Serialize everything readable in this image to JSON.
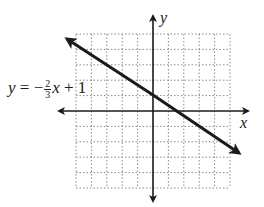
{
  "chart_data": {
    "type": "line",
    "title": "",
    "xlabel": "x",
    "ylabel": "y",
    "grid": true,
    "xlim": [
      -5,
      5
    ],
    "ylim": [
      -5,
      5
    ],
    "series": [
      {
        "name": "y = -2/3 x + 1",
        "equation": {
          "slope": -0.6667,
          "intercept": 1
        },
        "x": [
          -6,
          6
        ],
        "y": [
          5,
          -3
        ]
      }
    ],
    "annotations": [
      {
        "text": "y = -2/3 x + 1",
        "position": "left of y-axis, above x-axis"
      }
    ]
  },
  "labels": {
    "x_axis": "x",
    "y_axis": "y",
    "eq_y": "y",
    "eq_equals": " = −",
    "eq_num": "2",
    "eq_den": "3",
    "eq_x": "x",
    "eq_rest": " + 1"
  },
  "colors": {
    "axis": "#1a1a1a",
    "grid": "#8a8a8a",
    "line": "#1a1a1a"
  }
}
